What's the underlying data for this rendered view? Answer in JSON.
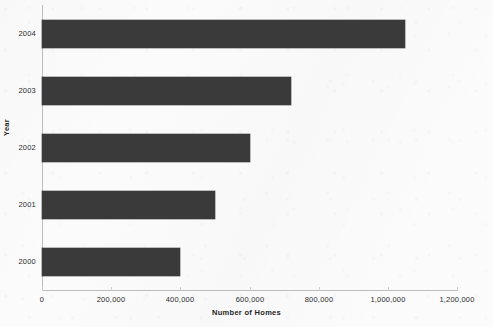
{
  "chart_data": {
    "type": "bar",
    "orientation": "horizontal",
    "title": "",
    "xlabel": "Number of Homes",
    "ylabel": "Year",
    "categories": [
      "2000",
      "2001",
      "2002",
      "2003",
      "2004"
    ],
    "values": [
      400000,
      500000,
      600000,
      720000,
      1050000
    ],
    "series": [
      {
        "name": "Number of Homes",
        "values": [
          400000,
          500000,
          600000,
          720000,
          1050000
        ],
        "color": "#3a3a3a"
      }
    ],
    "xlim": [
      0,
      1200000
    ],
    "xticks": [
      0,
      200000,
      400000,
      600000,
      800000,
      1000000,
      1200000
    ],
    "xtick_labels": [
      "0",
      "200,000",
      "400,000",
      "600,000",
      "800,000",
      "1,000,000",
      "1,200,000"
    ],
    "ytick_labels": [
      "2004",
      "2003",
      "2002",
      "2001",
      "2000"
    ],
    "grid": false,
    "legend": false,
    "legend_position": "none",
    "bar_color": "#3a3a3a",
    "background_color": "#fbfbfb",
    "axis_color": "#bdbdbd"
  }
}
